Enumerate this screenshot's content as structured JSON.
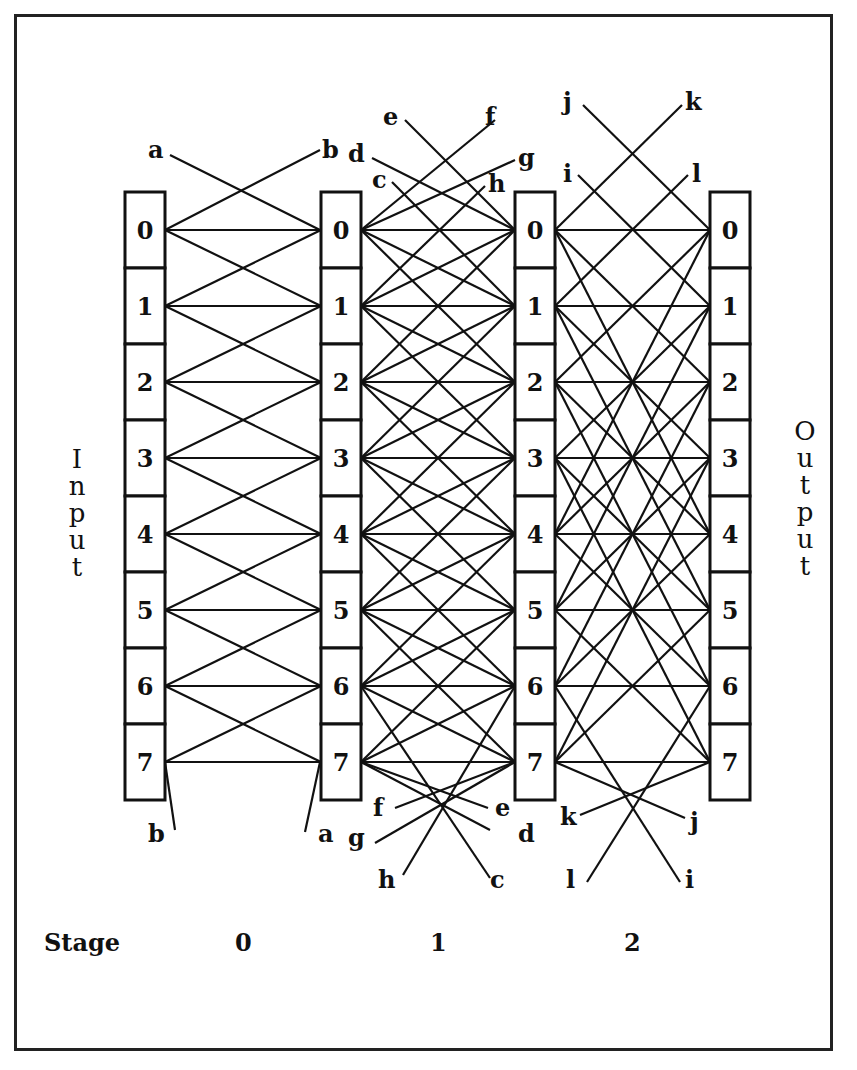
{
  "figure": {
    "side_labels": {
      "input": "Input",
      "output": "Output"
    },
    "stage_row": {
      "title": "Stage",
      "stages": [
        "0",
        "1",
        "2"
      ]
    },
    "columns": [
      {
        "id": "col0",
        "x": 145,
        "cells": [
          "0",
          "1",
          "2",
          "3",
          "4",
          "5",
          "6",
          "7"
        ]
      },
      {
        "id": "col1",
        "x": 341,
        "cells": [
          "0",
          "1",
          "2",
          "3",
          "4",
          "5",
          "6",
          "7"
        ]
      },
      {
        "id": "col2",
        "x": 535,
        "cells": [
          "0",
          "1",
          "2",
          "3",
          "4",
          "5",
          "6",
          "7"
        ]
      },
      {
        "id": "col3",
        "x": 730,
        "cells": [
          "0",
          "1",
          "2",
          "3",
          "4",
          "5",
          "6",
          "7"
        ]
      }
    ],
    "stage_offsets": [
      [
        0,
        1,
        -1
      ],
      [
        0,
        1,
        -1,
        2,
        -2
      ],
      [
        0,
        2,
        -2,
        4,
        -4
      ]
    ],
    "wrap_labels": {
      "stage0": {
        "top": [
          "a",
          "b"
        ],
        "bottom": [
          "b",
          "a"
        ]
      },
      "stage1": {
        "top": [
          "c",
          "d",
          "e",
          "f",
          "g",
          "h"
        ],
        "bottom": [
          "f",
          "e",
          "g",
          "d",
          "h",
          "c"
        ]
      },
      "stage2": {
        "top": [
          "i",
          "j",
          "k",
          "l"
        ],
        "bottom": [
          "k",
          "j",
          "l",
          "i"
        ]
      }
    },
    "colors": {
      "ink": "#111111",
      "paper": "#ffffff"
    }
  }
}
